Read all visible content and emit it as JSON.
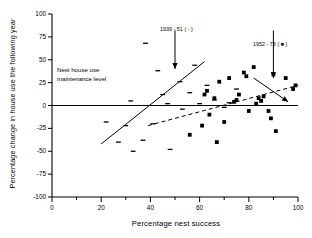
{
  "chart_data": {
    "type": "scatter",
    "title": "",
    "xlabel": "Percentage nest success",
    "ylabel": "Percentage change in house use the following year",
    "xlim": [
      0,
      100
    ],
    "ylim": [
      -100,
      100
    ],
    "xticks": [
      0,
      20,
      40,
      60,
      80,
      100
    ],
    "xticks_minor": [
      10,
      30,
      50,
      70,
      90
    ],
    "yticks": [
      100,
      75,
      50,
      25,
      0,
      -25,
      -50,
      -75,
      -100
    ],
    "grid": false,
    "legend_position": "in-plot-annotations",
    "annotations": [
      {
        "name": "maintenance-level",
        "text_lines": [
          "Nest house use",
          "maintenance level"
        ],
        "arrow_from": [
          82,
          30
        ],
        "arrow_to": [
          96,
          4
        ]
      },
      {
        "name": "series-1939-51-callout",
        "text": "1939 - 51 ( - )",
        "arrow_from": [
          50,
          82
        ],
        "arrow_to": [
          50,
          40
        ]
      },
      {
        "name": "series-1952-73-callout",
        "text": "1952 - 73 ( ■ )",
        "arrow_from": [
          90,
          82
        ],
        "arrow_to": [
          90,
          30
        ]
      }
    ],
    "series": [
      {
        "name": "1939 - 51",
        "label": "1939 - 51 ( - )",
        "marker": "dash",
        "color": "#000000",
        "points": [
          [
            22,
            -18
          ],
          [
            27,
            -40
          ],
          [
            30,
            -22
          ],
          [
            32,
            5
          ],
          [
            33,
            -50
          ],
          [
            37,
            -38
          ],
          [
            38,
            68
          ],
          [
            41,
            -20
          ],
          [
            43,
            38
          ],
          [
            45,
            12
          ],
          [
            47,
            2
          ],
          [
            48,
            -48
          ],
          [
            52,
            26
          ],
          [
            53,
            -4
          ],
          [
            56,
            14
          ],
          [
            58,
            44
          ],
          [
            60,
            2
          ],
          [
            63,
            22
          ],
          [
            66,
            6
          ],
          [
            70,
            -2
          ],
          [
            72,
            3
          ],
          [
            75,
            18
          ]
        ],
        "trendline": {
          "style": "solid",
          "x_start": 20,
          "x_end": 62,
          "y_start": -42,
          "y_end": 48
        }
      },
      {
        "name": "1952 - 73",
        "label": "1952 - 73 ( ■ )",
        "marker": "square",
        "color": "#000000",
        "points": [
          [
            56,
            -32
          ],
          [
            61,
            -22
          ],
          [
            62,
            12
          ],
          [
            63,
            16
          ],
          [
            64,
            -10
          ],
          [
            66,
            8
          ],
          [
            67,
            -40
          ],
          [
            68,
            26
          ],
          [
            70,
            -18
          ],
          [
            72,
            30
          ],
          [
            74,
            4
          ],
          [
            75,
            6
          ],
          [
            76,
            12
          ],
          [
            78,
            36
          ],
          [
            79,
            32
          ],
          [
            80,
            -6
          ],
          [
            82,
            42
          ],
          [
            83,
            2
          ],
          [
            84,
            8
          ],
          [
            85,
            5
          ],
          [
            86,
            10
          ],
          [
            88,
            -6
          ],
          [
            89,
            -14
          ],
          [
            90,
            34
          ],
          [
            91,
            -28
          ],
          [
            95,
            30
          ],
          [
            98,
            18
          ],
          [
            99,
            22
          ]
        ],
        "trendline": {
          "style": "dashed",
          "x_start": 39,
          "x_end": 100,
          "y_start": -22,
          "y_end": 22
        }
      }
    ],
    "reference_lines": [
      {
        "name": "zero-line",
        "axis": "y",
        "value": 0,
        "style": "solid"
      }
    ]
  }
}
